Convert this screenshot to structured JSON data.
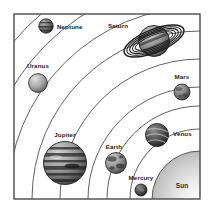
{
  "diagram": {
    "background_color": "#ffffff",
    "border_color": "#4a4a4a",
    "orbit_color": "#3a3a3a",
    "label_color": "#1a1a1a"
  },
  "sun": {
    "label": "Sun",
    "color_light": "#f2f2f2",
    "color_dark": "#a8a8a8",
    "label_x": 182,
    "label_y": 186
  },
  "planets": [
    {
      "name": "Neptune",
      "label": "Neptune",
      "cx": 46,
      "cy": 26,
      "r": 7.2,
      "color_light": "#9a9a9a",
      "color_dark": "#3c3c3c",
      "label_x": 57,
      "label_y": 26,
      "label_anchor": "start",
      "texture": "bands"
    },
    {
      "name": "Uranus",
      "label": "Uranus",
      "cx": 38,
      "cy": 83,
      "r": 9.4,
      "color_light": "#c8c8c8",
      "color_dark": "#6e6e6e",
      "label_x": 38,
      "label_y": 66,
      "label_anchor": "middle",
      "texture": "plain"
    },
    {
      "name": "Saturn",
      "label": "Saturn",
      "cx": 154,
      "cy": 41,
      "r": 15.5,
      "color_light": "#b4b4b4",
      "color_dark": "#4a4a4a",
      "label_x": 118,
      "label_y": 26,
      "label_anchor": "middle",
      "texture": "rings",
      "ring_tilt": -22,
      "ring_rx": 32,
      "ring_ry": 11
    },
    {
      "name": "Mars",
      "label": "Mars",
      "cx": 182,
      "cy": 92,
      "r": 8.0,
      "color_light": "#a0a0a0",
      "color_dark": "#4e4e4e",
      "label_x": 182,
      "label_y": 77,
      "label_anchor": "middle",
      "texture": "mottled"
    },
    {
      "name": "Jupiter",
      "label": "Jupiter",
      "cx": 65,
      "cy": 163,
      "r": 21.5,
      "color_light": "#b0b0b0",
      "color_dark": "#3a3a3a",
      "label_x": 65,
      "label_y": 135,
      "label_anchor": "middle",
      "texture": "bands"
    },
    {
      "name": "Venus",
      "label": "Venus",
      "cx": 157,
      "cy": 135,
      "r": 11.5,
      "color_light": "#7a7a7a",
      "color_dark": "#2a2a2a",
      "label_x": 173,
      "label_y": 134,
      "label_anchor": "start",
      "texture": "swirl"
    },
    {
      "name": "Earth",
      "label": "Earth",
      "cx": 116,
      "cy": 163,
      "r": 10.5,
      "color_light": "#b8b8b8",
      "color_dark": "#4a4a4a",
      "label_x": 116,
      "label_y": 147,
      "label_anchor": "middle",
      "texture": "mottled"
    },
    {
      "name": "Mercury",
      "label": "Mercury",
      "cx": 141,
      "cy": 190,
      "r": 6.0,
      "color_light": "#7e7e7e",
      "color_dark": "#242424",
      "label_x": 141,
      "label_y": 178,
      "label_anchor": "middle",
      "texture": "plain"
    }
  ],
  "orbits": [
    {
      "name": "mercury-orbit",
      "radius": 48
    },
    {
      "name": "venus-orbit",
      "radius": 70
    },
    {
      "name": "earth-orbit",
      "radius": 93
    },
    {
      "name": "mars-orbit",
      "radius": 112
    },
    {
      "name": "jupiter-orbit",
      "radius": 140
    },
    {
      "name": "saturn-orbit",
      "radius": 168
    },
    {
      "name": "uranus-orbit",
      "radius": 192
    },
    {
      "name": "neptune-orbit",
      "radius": 218
    }
  ]
}
